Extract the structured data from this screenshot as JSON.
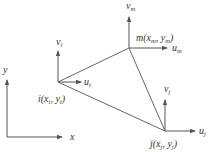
{
  "diagram": {
    "type": "triangular-element",
    "axes": {
      "x_label": "x",
      "y_label": "y"
    },
    "nodes": [
      {
        "id": "i",
        "label": "i",
        "coords_label": "(x",
        "sub_x": "i",
        "sep": ", y",
        "sub_y": "i",
        "close": ")",
        "u_label": "u",
        "u_sub": "i",
        "v_label": "v",
        "v_sub": "i"
      },
      {
        "id": "m",
        "label": "m",
        "coords_label": "(x",
        "sub_x": "m",
        "sep": ", y",
        "sub_y": "m",
        "close": ")",
        "u_label": "u",
        "u_sub": "m",
        "v_label": "v",
        "v_sub": "m"
      },
      {
        "id": "j",
        "label": "j",
        "coords_label": "(x",
        "sub_x": "j",
        "sep": ", y",
        "sub_y": "j",
        "close": ")",
        "u_label": "u",
        "u_sub": "j",
        "v_label": "v",
        "v_sub": "j"
      }
    ],
    "colors": {
      "line": "#555555",
      "text": "#333333",
      "background": "#ffffff"
    }
  }
}
